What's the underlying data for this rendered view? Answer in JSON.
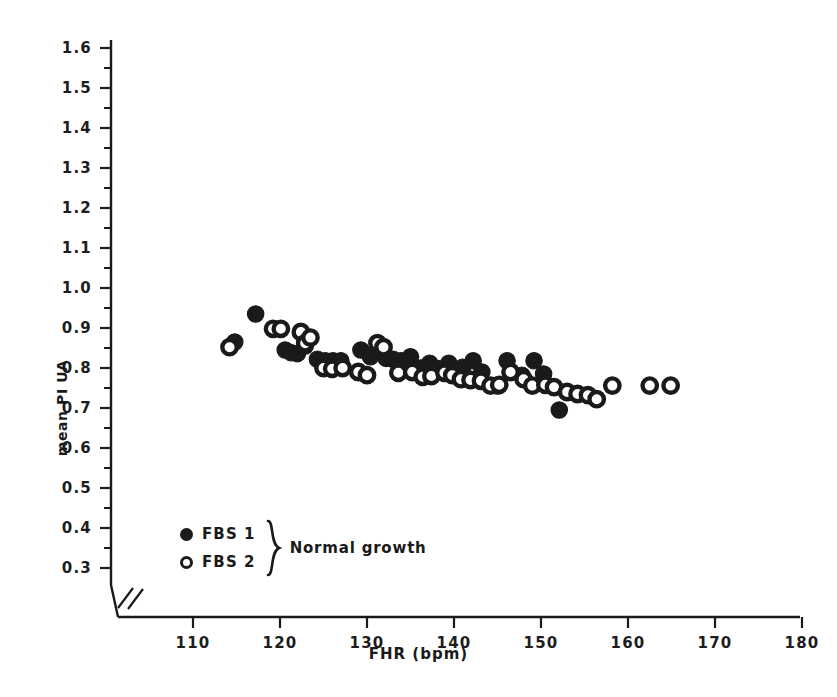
{
  "chart_data": {
    "type": "scatter",
    "title": "",
    "xlabel": "FHR (bpm)",
    "ylabel": "mean PI UA",
    "xlim": [
      104,
      183
    ],
    "ylim": [
      0.27,
      1.63
    ],
    "xticks": [
      110,
      120,
      130,
      140,
      150,
      160,
      170,
      180
    ],
    "yticks": [
      0.3,
      0.4,
      0.5,
      0.6,
      0.7,
      0.8,
      0.9,
      1.0,
      1.1,
      1.2,
      1.3,
      1.4,
      1.5,
      1.6
    ],
    "ytick_labels": [
      "0.3",
      "0.4",
      "0.5",
      "0.6",
      "0.7",
      "0.8",
      "0.9",
      "1.0",
      "1.1",
      "1.2",
      "1.3",
      "1.4",
      "1.5",
      "1.6"
    ],
    "xtick_labels": [
      "110",
      "120",
      "130",
      "140",
      "150",
      "160",
      "170",
      "180"
    ],
    "minor_yticks": [
      0.35,
      0.45,
      0.55,
      0.65,
      0.75,
      0.85,
      0.95,
      1.05,
      1.15,
      1.25,
      1.35,
      1.45,
      1.55
    ],
    "grid": false,
    "axis_break": true,
    "legend_position": "lower-left",
    "series": [
      {
        "name": "FBS 1",
        "marker": "filled-circle",
        "color": "#1a1a1a",
        "points": [
          [
            114.8,
            0.865
          ],
          [
            117.2,
            0.935
          ],
          [
            120.6,
            0.845
          ],
          [
            121.3,
            0.838
          ],
          [
            122.0,
            0.836
          ],
          [
            122.9,
            0.855
          ],
          [
            124.3,
            0.822
          ],
          [
            125.2,
            0.818
          ],
          [
            126.1,
            0.818
          ],
          [
            127.0,
            0.818
          ],
          [
            129.3,
            0.845
          ],
          [
            130.4,
            0.828
          ],
          [
            131.3,
            0.855
          ],
          [
            132.2,
            0.824
          ],
          [
            133.0,
            0.822
          ],
          [
            133.9,
            0.818
          ],
          [
            135.0,
            0.828
          ],
          [
            136.2,
            0.8
          ],
          [
            137.2,
            0.812
          ],
          [
            138.3,
            0.798
          ],
          [
            139.4,
            0.812
          ],
          [
            140.2,
            0.792
          ],
          [
            141.0,
            0.802
          ],
          [
            142.2,
            0.818
          ],
          [
            143.2,
            0.79
          ],
          [
            145.0,
            0.755
          ],
          [
            146.1,
            0.818
          ],
          [
            147.8,
            0.782
          ],
          [
            149.2,
            0.818
          ],
          [
            150.3,
            0.785
          ],
          [
            152.1,
            0.695
          ]
        ]
      },
      {
        "name": "FBS 2",
        "marker": "open-circle",
        "color": "#1a1a1a",
        "points": [
          [
            114.2,
            0.852
          ],
          [
            119.2,
            0.898
          ],
          [
            120.1,
            0.898
          ],
          [
            122.4,
            0.89
          ],
          [
            122.9,
            0.862
          ],
          [
            123.5,
            0.876
          ],
          [
            125.0,
            0.8
          ],
          [
            126.0,
            0.798
          ],
          [
            127.2,
            0.8
          ],
          [
            129.0,
            0.79
          ],
          [
            130.0,
            0.782
          ],
          [
            131.2,
            0.862
          ],
          [
            131.9,
            0.852
          ],
          [
            133.6,
            0.788
          ],
          [
            135.2,
            0.79
          ],
          [
            136.4,
            0.778
          ],
          [
            137.4,
            0.78
          ],
          [
            138.9,
            0.788
          ],
          [
            139.8,
            0.782
          ],
          [
            140.8,
            0.772
          ],
          [
            141.9,
            0.77
          ],
          [
            143.1,
            0.768
          ],
          [
            144.2,
            0.756
          ],
          [
            145.2,
            0.758
          ],
          [
            146.5,
            0.79
          ],
          [
            148.0,
            0.772
          ],
          [
            149.0,
            0.756
          ],
          [
            150.5,
            0.758
          ],
          [
            151.5,
            0.752
          ],
          [
            153.0,
            0.74
          ],
          [
            154.2,
            0.735
          ],
          [
            155.4,
            0.732
          ],
          [
            156.4,
            0.722
          ],
          [
            158.2,
            0.756
          ],
          [
            162.5,
            0.756
          ],
          [
            164.9,
            0.756
          ]
        ]
      }
    ]
  },
  "legend": {
    "entries": [
      {
        "label": "FBS 1",
        "marker": "filled-circle"
      },
      {
        "label": "FBS 2",
        "marker": "open-circle"
      }
    ],
    "group_label": "Normal growth"
  }
}
